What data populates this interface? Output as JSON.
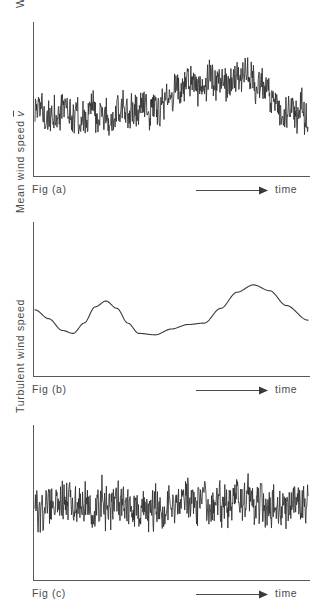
{
  "document": {
    "title": "Wind speed decomposition figures",
    "background_color": "#ffffff",
    "ink_color": "#3a3a3a"
  },
  "panels": [
    {
      "id": "a",
      "caption": "Fig (a)",
      "ylabel_text": "Wind speed",
      "ylabel_symbol": "v",
      "ylabel_symbol_style": "italic",
      "xlabel": "time",
      "x_arrow_icon": "right-arrow-icon"
    },
    {
      "id": "b",
      "caption": "Fig (b)",
      "ylabel_text": "Mean wind speed",
      "ylabel_symbol": "v",
      "ylabel_symbol_style": "italic-overbar",
      "xlabel": "time",
      "x_arrow_icon": "right-arrow-icon"
    },
    {
      "id": "c",
      "caption": "Fig (c)",
      "ylabel_text": "Turbulent wind speed",
      "ylabel_symbol": "",
      "ylabel_symbol_style": "none",
      "xlabel": "time",
      "x_arrow_icon": "right-arrow-icon"
    }
  ],
  "chart_data": [
    {
      "type": "line",
      "id": "fig-a-instantaneous-wind-speed",
      "title": "Fig (a)",
      "xlabel": "time",
      "ylabel": "Wind speed v",
      "grid": false,
      "legend": false,
      "axis_style": "L-shaped, unlabeled ticks",
      "xlim": [
        0,
        1
      ],
      "ylim": [
        0,
        1
      ],
      "description": "Instantaneous wind speed: broadband high-frequency turbulence superimposed on a slowly varying mean that rises over the middle-right of the record then falls near the end.",
      "envelope_mean": {
        "x": [
          0.0,
          0.08,
          0.16,
          0.24,
          0.32,
          0.4,
          0.48,
          0.56,
          0.62,
          0.7,
          0.78,
          0.84,
          0.9,
          0.96,
          1.0
        ],
        "y": [
          0.4,
          0.43,
          0.41,
          0.38,
          0.42,
          0.45,
          0.48,
          0.62,
          0.66,
          0.64,
          0.67,
          0.6,
          0.44,
          0.46,
          0.42
        ]
      },
      "noise_amplitude": 0.13,
      "sample_count": 620
    },
    {
      "type": "line",
      "id": "fig-b-mean-wind-speed",
      "title": "Fig (b)",
      "xlabel": "time",
      "ylabel": "Mean wind speed v̄",
      "grid": false,
      "legend": false,
      "axis_style": "L-shaped, unlabeled ticks",
      "xlim": [
        0,
        1
      ],
      "ylim": [
        0,
        1
      ],
      "description": "Smooth low-frequency mean wind speed: starts mid-level, dips to a trough, rises to a small local peak, falls to a second trough, rises gradually to a broad maximum, then decays toward the right edge.",
      "x": [
        0.0,
        0.05,
        0.1,
        0.14,
        0.18,
        0.22,
        0.26,
        0.3,
        0.34,
        0.38,
        0.44,
        0.5,
        0.56,
        0.62,
        0.68,
        0.74,
        0.8,
        0.86,
        0.92,
        1.0
      ],
      "y": [
        0.45,
        0.39,
        0.31,
        0.29,
        0.36,
        0.47,
        0.51,
        0.46,
        0.36,
        0.29,
        0.28,
        0.32,
        0.35,
        0.36,
        0.46,
        0.57,
        0.62,
        0.58,
        0.48,
        0.38
      ]
    },
    {
      "type": "line",
      "id": "fig-c-turbulent-wind-speed",
      "title": "Fig (c)",
      "xlabel": "time",
      "ylabel": "Turbulent wind speed",
      "grid": false,
      "legend": false,
      "axis_style": "L-shaped, unlabeled ticks",
      "xlim": [
        0,
        1
      ],
      "ylim": [
        0,
        1
      ],
      "description": "Turbulent fluctuation component: zero-mean stationary broadband noise of roughly constant amplitude across the whole record.",
      "mean_level": 0.5,
      "noise_amplitude": 0.16,
      "sample_count": 620
    }
  ]
}
